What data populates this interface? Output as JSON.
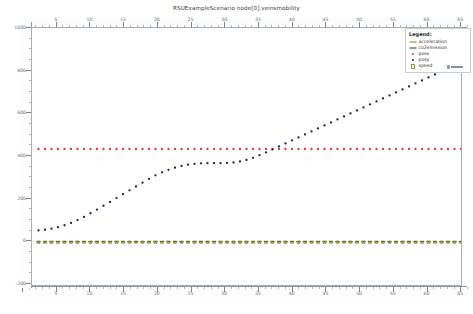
{
  "chart_data": {
    "type": "line",
    "title": "RSUExampleScenario node[0].veinsmobility",
    "xlabel": "",
    "ylabel": "",
    "xlim": [
      0,
      66
    ],
    "ylim": [
      -200,
      1000
    ],
    "grid": false,
    "legend_position": "top-right",
    "x_ticks": [
      0,
      5,
      10,
      15,
      20,
      25,
      30,
      35,
      40,
      45,
      50,
      55,
      60,
      65
    ],
    "y_ticks": [
      -200,
      0,
      200,
      400,
      600,
      800,
      1000
    ],
    "series": [
      {
        "name": "acceleration",
        "color": "#7b8a2e",
        "marker": "dash",
        "values": [
          0,
          0,
          0,
          0,
          0,
          0,
          0,
          0,
          0,
          0,
          0,
          0,
          0,
          0,
          0,
          0,
          0,
          0,
          0,
          0,
          0,
          0,
          0,
          0,
          0,
          0,
          0,
          0,
          0,
          0,
          0,
          0,
          0,
          0,
          0,
          0,
          0,
          0,
          0,
          0,
          0,
          0,
          0,
          0,
          0,
          0,
          0,
          0,
          0,
          0,
          0,
          0,
          0,
          0,
          0,
          0,
          0,
          0,
          0,
          0,
          0,
          0,
          0,
          0,
          0,
          0
        ]
      },
      {
        "name": "co2emission",
        "color": "#2f2f2f",
        "marker": "dash",
        "values": [
          2,
          2,
          2,
          3,
          3,
          3,
          3,
          3,
          3,
          3,
          3,
          3,
          3,
          3,
          3,
          3,
          3,
          3,
          3,
          3,
          3,
          3,
          3,
          3,
          3,
          3,
          3,
          3,
          2,
          2,
          2,
          2,
          2,
          2,
          3,
          3,
          3,
          3,
          3,
          3,
          3,
          3,
          3,
          3,
          3,
          3,
          3,
          3,
          3,
          3,
          3,
          3,
          3,
          3,
          3,
          3,
          3,
          3,
          3,
          3,
          3,
          3,
          3,
          3,
          3,
          3
        ]
      },
      {
        "name": "posx",
        "color": "#e0382e",
        "marker": "dot",
        "values": [
          435,
          435,
          435,
          435,
          435,
          435,
          435,
          435,
          435,
          435,
          435,
          435,
          435,
          435,
          435,
          435,
          435,
          435,
          435,
          435,
          435,
          435,
          435,
          435,
          435,
          435,
          435,
          435,
          435,
          435,
          435,
          435,
          435,
          435,
          435,
          435,
          435,
          435,
          435,
          435,
          435,
          435,
          435,
          435,
          435,
          435,
          435,
          435,
          435,
          435,
          435,
          435,
          435,
          435,
          435,
          435,
          435,
          435,
          435,
          435,
          435,
          435,
          435,
          435,
          435,
          435
        ]
      },
      {
        "name": "posy",
        "color": "#1c1f4f",
        "marker": "dot",
        "values": [
          55,
          58,
          63,
          70,
          79,
          90,
          103,
          118,
          135,
          152,
          170,
          188,
          206,
          224,
          242,
          260,
          278,
          296,
          312,
          326,
          338,
          348,
          356,
          362,
          366,
          368,
          369,
          369,
          369,
          370,
          372,
          377,
          384,
          394,
          406,
          419,
          433,
          447,
          461,
          475,
          489,
          503,
          517,
          531,
          545,
          559,
          573,
          587,
          601,
          615,
          629,
          643,
          657,
          671,
          685,
          699,
          713,
          727,
          741,
          755,
          769,
          783,
          797,
          811,
          825,
          840
        ]
      },
      {
        "name": "speed",
        "color": "#8a8f2b",
        "marker": "sq",
        "values": [
          0,
          0,
          0,
          0,
          0,
          0,
          0,
          0,
          0,
          0,
          0,
          0,
          0,
          0,
          0,
          0,
          0,
          0,
          0,
          0,
          0,
          0,
          0,
          0,
          0,
          0,
          0,
          0,
          0,
          0,
          0,
          0,
          0,
          0,
          0,
          0,
          0,
          0,
          0,
          0,
          0,
          0,
          0,
          0,
          0,
          0,
          0,
          0,
          0,
          0,
          0,
          0,
          0,
          0,
          0,
          0,
          0,
          0,
          0,
          0,
          0,
          0,
          0,
          0,
          0,
          0
        ]
      }
    ]
  },
  "legend": {
    "title": "Legend:",
    "entries": [
      {
        "label": "acceleration",
        "color": "#7b8a2e",
        "marker": "dash"
      },
      {
        "label": "co2emission",
        "color": "#2f2f2f",
        "marker": "dash"
      },
      {
        "label": "posx",
        "color": "#e0382e",
        "marker": "dot"
      },
      {
        "label": "posy",
        "color": "#1c1f4f",
        "marker": "dot"
      },
      {
        "label": "speed",
        "color": "#8a8f2b",
        "marker": "sq"
      }
    ]
  }
}
